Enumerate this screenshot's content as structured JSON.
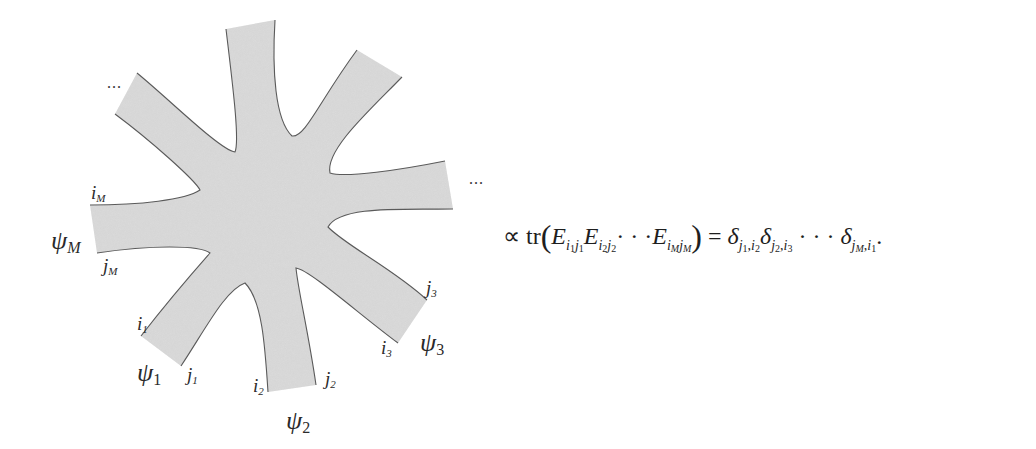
{
  "figure": {
    "shape": "ribbon-graph vertex with M legs",
    "fill_color": "#dcdcdc",
    "stroke_color": "#555555",
    "ellipsis_top_left": "...",
    "ellipsis_right": "...",
    "legs": [
      {
        "psi": "ψ",
        "psi_sub": "M",
        "i_label": "i",
        "i_sub": "M",
        "j_label": "j",
        "j_sub": "M"
      },
      {
        "psi": "ψ",
        "psi_sub": "1",
        "i_label": "i",
        "i_sub": "1",
        "j_label": "j",
        "j_sub": "1"
      },
      {
        "psi": "ψ",
        "psi_sub": "2",
        "i_label": "i",
        "i_sub": "2",
        "j_label": "j",
        "j_sub": "2"
      },
      {
        "psi": "ψ",
        "psi_sub": "3",
        "i_label": "i",
        "i_sub": "3",
        "j_label": "j",
        "j_sub": "3"
      }
    ]
  },
  "formula": {
    "propto": "∝",
    "tr": "tr",
    "lparen": "(",
    "rparen": ")",
    "E": "E",
    "E1_sub_i": "i",
    "E1_sub_i_idx": "1",
    "E1_sub_j": "j",
    "E1_sub_j_idx": "1",
    "E2_sub_i": "i",
    "E2_sub_i_idx": "2",
    "E2_sub_j": "j",
    "E2_sub_j_idx": "2",
    "cdots": "· · ·",
    "EM_sub_i": "i",
    "EM_sub_i_idx": "M",
    "EM_sub_j": "j",
    "EM_sub_j_idx": "M",
    "equals": "=",
    "delta": "δ",
    "d1_sub": "j",
    "d1_a": "1",
    "d1_b": "i",
    "d1_b_idx": "2",
    "d2_sub": "j",
    "d2_a": "2",
    "d2_b": "i",
    "d2_b_idx": "3",
    "dM_sub": "j",
    "dM_a": "M",
    "dM_b": "i",
    "dM_b_idx": "1",
    "comma": ",",
    "period": "."
  }
}
